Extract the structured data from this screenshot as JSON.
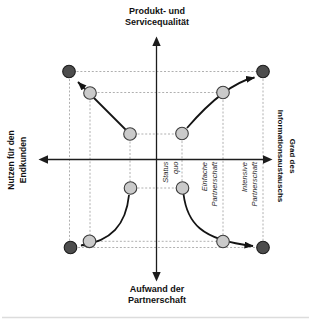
{
  "axes": {
    "top": {
      "lines": [
        "Produkt- und",
        "Servicequalität"
      ]
    },
    "bottom": {
      "lines": [
        "Aufwand der",
        "Partnerschaft"
      ]
    },
    "left": {
      "lines": [
        "Nutzen für den",
        "Endkunden"
      ]
    },
    "right": {
      "lines": [
        "Grad des",
        "Informationsaustauschs"
      ]
    }
  },
  "zones": {
    "status_quo": {
      "lines": [
        "Status",
        "quo"
      ]
    },
    "einfache_partnerschaft": {
      "lines": [
        "Einfache",
        "Partnerschaft"
      ]
    },
    "intensive_partnerschaft": {
      "lines": [
        "Intensive",
        "Partnerschaft"
      ]
    }
  },
  "colors": {
    "background": "#ffffff",
    "axis": "#1c1c1c",
    "arrow": "#141414",
    "dashed_guides": "#9c9c9c",
    "node_light_fill": "#cacaca",
    "node_light_stroke": "#3c3c3c",
    "node_dark_fill": "#4d4d4d",
    "node_dark_stroke": "#1c1c1c"
  }
}
